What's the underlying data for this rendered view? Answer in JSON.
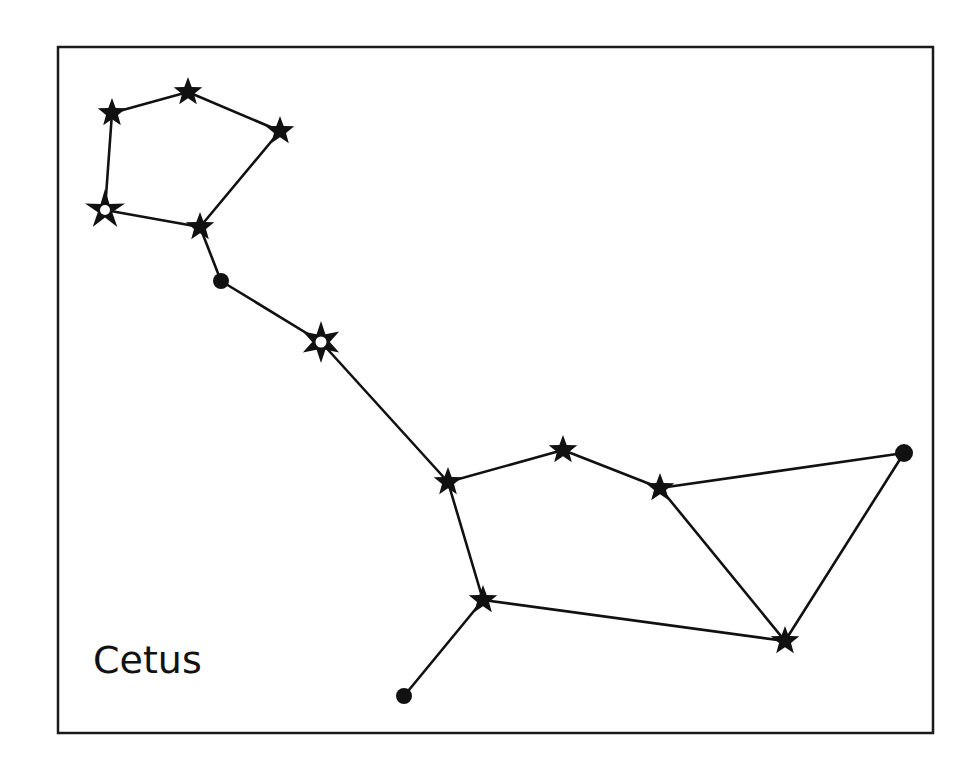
{
  "diagram": {
    "title": "Cetus",
    "type": "constellation-chart",
    "colors": {
      "background": "#ffffff",
      "ink": "#111111",
      "frame": "#1a1a1a"
    },
    "frame": {
      "x": 58,
      "y": 47,
      "width": 875,
      "height": 686
    },
    "label": {
      "text": "Cetus",
      "x": 93,
      "y": 673
    },
    "nodes": [
      {
        "id": "s1",
        "shape": "star5",
        "x": 112,
        "y": 113,
        "r": 15
      },
      {
        "id": "s2",
        "shape": "star5",
        "x": 188,
        "y": 92,
        "r": 15
      },
      {
        "id": "s3",
        "shape": "star5",
        "x": 280,
        "y": 131,
        "r": 15
      },
      {
        "id": "s4",
        "shape": "star5-hollow",
        "x": 105,
        "y": 210,
        "r": 21
      },
      {
        "id": "s5",
        "shape": "star5",
        "x": 200,
        "y": 227,
        "r": 15
      },
      {
        "id": "d1",
        "shape": "dot",
        "x": 221,
        "y": 281,
        "r": 8
      },
      {
        "id": "s6",
        "shape": "star6-hollow",
        "x": 321,
        "y": 342,
        "r": 21
      },
      {
        "id": "s7",
        "shape": "star5",
        "x": 448,
        "y": 482,
        "r": 15
      },
      {
        "id": "s8",
        "shape": "star5",
        "x": 563,
        "y": 450,
        "r": 15
      },
      {
        "id": "s9",
        "shape": "star5",
        "x": 660,
        "y": 488,
        "r": 15
      },
      {
        "id": "d2",
        "shape": "dot",
        "x": 904,
        "y": 453,
        "r": 9
      },
      {
        "id": "s10",
        "shape": "star5",
        "x": 483,
        "y": 600,
        "r": 15
      },
      {
        "id": "s11",
        "shape": "star5",
        "x": 785,
        "y": 641,
        "r": 15
      },
      {
        "id": "d3",
        "shape": "dot",
        "x": 404,
        "y": 696,
        "r": 8
      }
    ],
    "edges": [
      [
        "s1",
        "s2"
      ],
      [
        "s2",
        "s3"
      ],
      [
        "s3",
        "s5"
      ],
      [
        "s1",
        "s4"
      ],
      [
        "s4",
        "s5"
      ],
      [
        "s5",
        "d1"
      ],
      [
        "d1",
        "s6"
      ],
      [
        "s6",
        "s7"
      ],
      [
        "s7",
        "s8"
      ],
      [
        "s8",
        "s9"
      ],
      [
        "s9",
        "d2"
      ],
      [
        "s9",
        "s11"
      ],
      [
        "d2",
        "s11"
      ],
      [
        "s7",
        "s10"
      ],
      [
        "s10",
        "s11"
      ],
      [
        "s10",
        "d3"
      ]
    ]
  }
}
